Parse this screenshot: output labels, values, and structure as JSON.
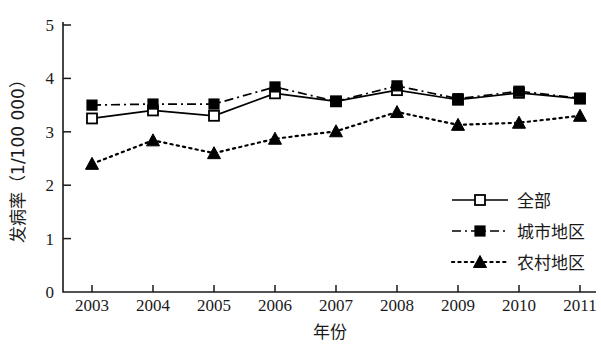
{
  "chart_data": {
    "type": "line",
    "title": "",
    "xlabel": "年份",
    "ylabel": "发病率（1/100 000）",
    "x": [
      2003,
      2004,
      2005,
      2006,
      2007,
      2008,
      2009,
      2010,
      2011
    ],
    "xtick_labels": [
      "2003",
      "2004",
      "2005",
      "2006",
      "2007",
      "2008",
      "2009",
      "2010",
      "2011"
    ],
    "ytick_labels": [
      "0",
      "1",
      "2",
      "3",
      "4",
      "5"
    ],
    "yticks": [
      0,
      1,
      2,
      3,
      4,
      5
    ],
    "ylim": [
      0,
      5
    ],
    "grid": false,
    "legend_position": "right-middle",
    "series": [
      {
        "name": "全部",
        "marker": "open-square",
        "linestyle": "solid",
        "color": "#000000",
        "values": [
          3.25,
          3.4,
          3.3,
          3.72,
          3.57,
          3.78,
          3.6,
          3.73,
          3.62
        ]
      },
      {
        "name": "城市地区",
        "marker": "filled-square",
        "linestyle": "dash-dot",
        "color": "#000000",
        "values": [
          3.5,
          3.52,
          3.52,
          3.84,
          3.57,
          3.86,
          3.62,
          3.76,
          3.63
        ]
      },
      {
        "name": "农村地区",
        "marker": "filled-triangle",
        "linestyle": "dotted",
        "color": "#000000",
        "values": [
          2.4,
          2.84,
          2.6,
          2.87,
          3.01,
          3.37,
          3.13,
          3.17,
          3.3
        ]
      }
    ]
  },
  "axes": {
    "y_title": "发病率（1/100 000）",
    "x_title": "年份"
  },
  "legend": {
    "entries": [
      {
        "label": "全部"
      },
      {
        "label": "城市地区"
      },
      {
        "label": "农村地区"
      }
    ]
  }
}
